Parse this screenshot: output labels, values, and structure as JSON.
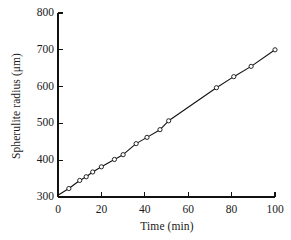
{
  "chart_data": {
    "type": "line",
    "title": "",
    "subtitle": "",
    "xlabel": "Time (min)",
    "ylabel": "Spherulite radius (μm)",
    "xlim": [
      0,
      100
    ],
    "ylim": [
      300,
      800
    ],
    "xticks": [
      0,
      20,
      40,
      60,
      80,
      100
    ],
    "yticks": [
      300,
      400,
      500,
      600,
      700,
      800
    ],
    "xtick_labels": [
      "0",
      "20",
      "40",
      "60",
      "80",
      "100"
    ],
    "ytick_labels": [
      "300",
      "400",
      "500",
      "600",
      "700",
      "800"
    ],
    "grid": false,
    "legend": null,
    "legend_position": "none",
    "axis_style": "left-and-bottom-spines",
    "tick_direction": "in",
    "marker": "open-circle",
    "marker_color": "#ffffff",
    "marker_edge_color": "#111111",
    "line_color": "#111111",
    "line_width": 1.1,
    "series": [
      {
        "name": "Spherulite radius",
        "x": [
          0,
          5,
          10,
          13,
          16,
          20,
          26,
          30,
          36,
          41,
          47,
          51,
          73,
          81,
          89,
          100
        ],
        "y": [
          305,
          323,
          345,
          355,
          368,
          382,
          402,
          415,
          445,
          462,
          483,
          507,
          597,
          627,
          655,
          700
        ]
      }
    ],
    "fit": {
      "description": "linear growth",
      "intercept": 305,
      "slope": 3.95,
      "slope_units": "μm/min"
    }
  },
  "figure": {
    "background_color": "#ffffff",
    "text_color": "#1a1a1a"
  }
}
